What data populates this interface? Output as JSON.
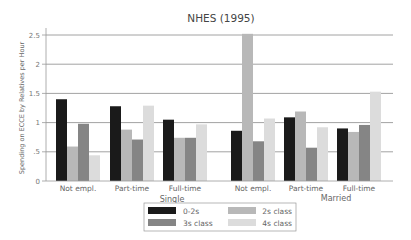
{
  "chart_data": {
    "type": "bar",
    "title": "NHES (1995)",
    "xlabel": "",
    "ylabel": "Spending on ECCE by Relatives per Hour",
    "ylim": [
      0,
      2.5
    ],
    "yticks": [
      "0",
      ".5",
      "1",
      "1.5",
      "2",
      "2.5"
    ],
    "grid": true,
    "legend_position": "bottom-center",
    "groups": [
      "Single",
      "Married"
    ],
    "categories": [
      "Not empl.",
      "Part-time",
      "Full-time",
      "Not empl.",
      "Part-time",
      "Full-time"
    ],
    "series": [
      {
        "name": "0-2s",
        "color": "#1a1a1a",
        "values": [
          1.4,
          1.28,
          1.05,
          0.86,
          1.09,
          0.9
        ]
      },
      {
        "name": "2s class",
        "color": "#b8b8b8",
        "values": [
          0.59,
          0.88,
          0.74,
          2.52,
          1.19,
          0.84
        ]
      },
      {
        "name": "3s class",
        "color": "#858585",
        "values": [
          0.98,
          0.71,
          0.74,
          0.68,
          0.57,
          0.96
        ]
      },
      {
        "name": "4s class",
        "color": "#dcdcdc",
        "values": [
          0.44,
          1.29,
          0.97,
          1.07,
          0.92,
          1.53
        ]
      }
    ]
  }
}
